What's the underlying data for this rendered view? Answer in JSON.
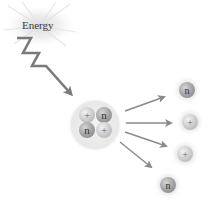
{
  "diagram": {
    "energy_label": "Energy",
    "nucleus": {
      "particles": [
        {
          "type": "proton",
          "symbol": "+"
        },
        {
          "type": "neutron",
          "symbol": "n"
        },
        {
          "type": "neutron",
          "symbol": "n"
        },
        {
          "type": "proton",
          "symbol": "+"
        }
      ]
    },
    "emitted_particles": [
      {
        "type": "neutron",
        "symbol": "n"
      },
      {
        "type": "proton",
        "symbol": "+"
      },
      {
        "type": "proton",
        "symbol": "+"
      },
      {
        "type": "neutron",
        "symbol": "n"
      }
    ],
    "colors": {
      "arrow": "#8a8a8a",
      "bolt": "#7a7a7a",
      "glow": "#dcdcdc"
    }
  }
}
